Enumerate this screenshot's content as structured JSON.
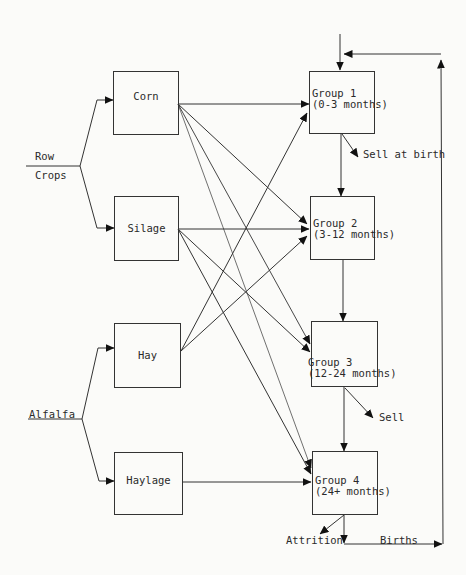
{
  "diagram": {
    "sources": [
      {
        "id": "row-crops",
        "label_line1": "Row",
        "label_line2": "Crops"
      },
      {
        "id": "alfalfa",
        "label": "Alfalfa"
      }
    ],
    "feeds": [
      {
        "id": "corn",
        "label": "Corn",
        "source": "row-crops"
      },
      {
        "id": "silage",
        "label": "Silage",
        "source": "row-crops"
      },
      {
        "id": "hay",
        "label": "Hay",
        "source": "alfalfa"
      },
      {
        "id": "haylage",
        "label": "Haylage",
        "source": "alfalfa"
      }
    ],
    "groups": [
      {
        "id": "group1",
        "label": "Group 1\n(0-3 months)"
      },
      {
        "id": "group2",
        "label": "Group 2\n(3-12 months)"
      },
      {
        "id": "group3",
        "label": "Group 3\n(12-24 months)"
      },
      {
        "id": "group4",
        "label": "Group 4\n(24+ months)"
      }
    ],
    "outflows": {
      "group1": "Sell at birth",
      "group3": "Sell",
      "group4_attrition": "Attrition",
      "births": "Births"
    },
    "edges": [
      {
        "from": "corn",
        "to": [
          "group1",
          "group2",
          "group3",
          "group4"
        ]
      },
      {
        "from": "silage",
        "to": [
          "group2",
          "group3",
          "group4"
        ]
      },
      {
        "from": "hay",
        "to": [
          "group1",
          "group2"
        ]
      },
      {
        "from": "haylage",
        "to": [
          "group4"
        ]
      },
      {
        "from": "group1",
        "to": [
          "group2",
          "sell-at-birth"
        ]
      },
      {
        "from": "group2",
        "to": [
          "group3"
        ]
      },
      {
        "from": "group3",
        "to": [
          "group4",
          "sell"
        ]
      },
      {
        "from": "group4",
        "to": [
          "attrition",
          "births"
        ]
      },
      {
        "from": "births",
        "to": [
          "group1"
        ]
      }
    ]
  }
}
